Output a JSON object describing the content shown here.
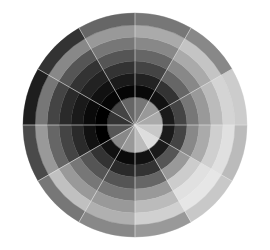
{
  "figure": {
    "title": "Grayscale radial color wheel",
    "background": "#ffffff",
    "center": [
      135,
      125
    ],
    "radii": [
      0,
      28,
      40,
      52,
      64,
      76,
      88,
      100,
      112
    ],
    "ring_labels": [
      "disc",
      "ring-1",
      "ring-2",
      "ring-3",
      "ring-4",
      "ring-5",
      "ring-6",
      "ring-7"
    ],
    "sector_count": 12,
    "sector_degrees": 30,
    "divider_color": "#e8e8e8",
    "divider_width": 0.8,
    "sectors": [
      {
        "start": 0,
        "end": 30,
        "grays": [
          "#aaaaaa",
          "#1a1a1a",
          "#444444",
          "#777777",
          "#999999",
          "#bbbbbb",
          "#d4d4d4",
          "#cccccc"
        ]
      },
      {
        "start": 30,
        "end": 60,
        "grays": [
          "#999999",
          "#111111",
          "#333333",
          "#666666",
          "#888888",
          "#aaaaaa",
          "#c4c4c4",
          "#888888"
        ]
      },
      {
        "start": 60,
        "end": 90,
        "grays": [
          "#777777",
          "#080808",
          "#222222",
          "#444444",
          "#666666",
          "#888888",
          "#aaaaaa",
          "#777777"
        ]
      },
      {
        "start": 90,
        "end": 120,
        "grays": [
          "#666666",
          "#050505",
          "#1a1a1a",
          "#333333",
          "#555555",
          "#777777",
          "#999999",
          "#666666"
        ]
      },
      {
        "start": 120,
        "end": 150,
        "grays": [
          "#444444",
          "#050505",
          "#111111",
          "#222222",
          "#333333",
          "#555555",
          "#888888",
          "#333333"
        ]
      },
      {
        "start": 150,
        "end": 180,
        "grays": [
          "#333333",
          "#000000",
          "#0a0a0a",
          "#1a1a1a",
          "#2a2a2a",
          "#444444",
          "#777777",
          "#1e1e1e"
        ]
      },
      {
        "start": 180,
        "end": 210,
        "grays": [
          "#555555",
          "#000000",
          "#111111",
          "#2a2a2a",
          "#444444",
          "#666666",
          "#999999",
          "#4a4a4a"
        ]
      },
      {
        "start": 210,
        "end": 240,
        "grays": [
          "#888888",
          "#111111",
          "#333333",
          "#555555",
          "#777777",
          "#999999",
          "#c0c0c0",
          "#777777"
        ]
      },
      {
        "start": 240,
        "end": 270,
        "grays": [
          "#999999",
          "#0a0a0a",
          "#2a2a2a",
          "#555555",
          "#777777",
          "#999999",
          "#b0b0b0",
          "#888888"
        ]
      },
      {
        "start": 270,
        "end": 300,
        "grays": [
          "#bbbbbb",
          "#111111",
          "#333333",
          "#666666",
          "#999999",
          "#bbbbbb",
          "#d0d0d0",
          "#999999"
        ]
      },
      {
        "start": 300,
        "end": 330,
        "grays": [
          "#dddddd",
          "#1a1a1a",
          "#555555",
          "#999999",
          "#cccccc",
          "#e0e0e0",
          "#e6e6e6",
          "#c8c8c8"
        ]
      },
      {
        "start": 330,
        "end": 360,
        "grays": [
          "#c8c8c8",
          "#1a1a1a",
          "#444444",
          "#888888",
          "#aaaaaa",
          "#cfcfcf",
          "#e0e0e0",
          "#bbbbbb"
        ]
      }
    ]
  }
}
